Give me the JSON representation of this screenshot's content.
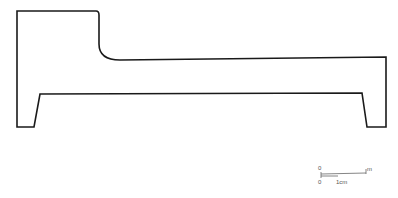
{
  "figure": {
    "type": "profile-cross-section",
    "stroke_color": "#1a1a1a",
    "background": "#ffffff"
  },
  "scale_bar": {
    "top": {
      "start_label": "0",
      "end_label": "m"
    },
    "bottom": {
      "start_label": "0",
      "end_label": "1cm"
    },
    "color": "#666666"
  }
}
